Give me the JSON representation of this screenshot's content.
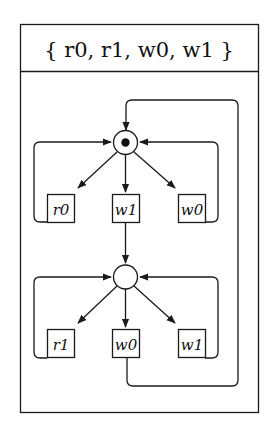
{
  "title": "{ r0, r1, w0, w1 }",
  "colors": {
    "ink": "#1a1a1a",
    "background": "#ffffff",
    "token": "#111111"
  },
  "places": [
    {
      "id": "p_top",
      "tokens": 1
    },
    {
      "id": "p_bottom",
      "tokens": 0
    }
  ],
  "transitions": {
    "top": [
      {
        "id": "r0_top",
        "label": "r0"
      },
      {
        "id": "w1_top",
        "label": "w1"
      },
      {
        "id": "w0_top",
        "label": "w0"
      }
    ],
    "bottom": [
      {
        "id": "r1_bottom",
        "label": "r1"
      },
      {
        "id": "w0_bottom",
        "label": "w0"
      },
      {
        "id": "w1_bottom",
        "label": "w1"
      }
    ]
  },
  "arcs": [
    "p_top -> r0_top",
    "r0_top -> p_top",
    "p_top -> w1_top",
    "w1_top -> p_bottom",
    "p_top -> w0_top",
    "w0_top -> p_top",
    "p_bottom -> r1_bottom",
    "r1_bottom -> p_bottom",
    "p_bottom -> w0_bottom",
    "w0_bottom -> p_top",
    "p_bottom -> w1_bottom",
    "w1_bottom -> p_bottom"
  ]
}
